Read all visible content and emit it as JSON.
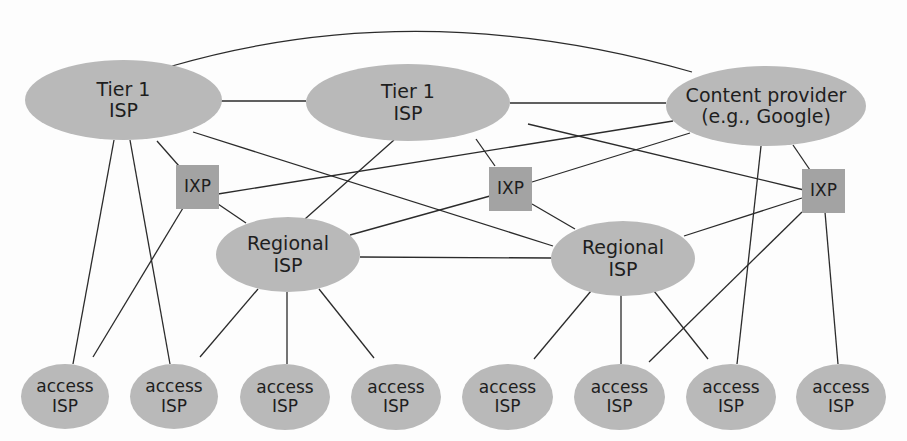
{
  "diagram": {
    "type": "network-topology",
    "colors": {
      "node_fill": "#b9b9b9",
      "ixp_fill": "#a3a3a3",
      "edge": "#2b2b2b",
      "text": "#1e1e1e",
      "background": "#fdfdfd"
    },
    "nodes": {
      "tier1_a": {
        "line1": "Tier 1",
        "line2": "ISP",
        "kind": "tier1-isp"
      },
      "tier1_b": {
        "line1": "Tier 1",
        "line2": "ISP",
        "kind": "tier1-isp"
      },
      "content": {
        "line1": "Content provider",
        "line2": "(e.g., Google)",
        "kind": "content-provider"
      },
      "ixp_1": {
        "label": "IXP",
        "kind": "ixp"
      },
      "ixp_2": {
        "label": "IXP",
        "kind": "ixp"
      },
      "ixp_3": {
        "label": "IXP",
        "kind": "ixp"
      },
      "regional_a": {
        "line1": "Regional",
        "line2": "ISP",
        "kind": "regional-isp"
      },
      "regional_b": {
        "line1": "Regional",
        "line2": "ISP",
        "kind": "regional-isp"
      },
      "access": [
        {
          "line1": "access",
          "line2": "ISP"
        },
        {
          "line1": "access",
          "line2": "ISP"
        },
        {
          "line1": "access",
          "line2": "ISP"
        },
        {
          "line1": "access",
          "line2": "ISP"
        },
        {
          "line1": "access",
          "line2": "ISP"
        },
        {
          "line1": "access",
          "line2": "ISP"
        },
        {
          "line1": "access",
          "line2": "ISP"
        },
        {
          "line1": "access",
          "line2": "ISP"
        }
      ]
    },
    "edges": [
      [
        "tier1_a",
        "content",
        "arc"
      ],
      [
        "tier1_a",
        "tier1_b"
      ],
      [
        "tier1_a",
        "ixp_1"
      ],
      [
        "tier1_a",
        "regional_b"
      ],
      [
        "tier1_a",
        "access_1"
      ],
      [
        "tier1_a",
        "access_2"
      ],
      [
        "tier1_b",
        "content"
      ],
      [
        "tier1_b",
        "ixp_2"
      ],
      [
        "tier1_b",
        "regional_a"
      ],
      [
        "tier1_b",
        "ixp_3"
      ],
      [
        "content",
        "ixp_1"
      ],
      [
        "content",
        "ixp_2"
      ],
      [
        "content",
        "ixp_3"
      ],
      [
        "content",
        "access_7"
      ],
      [
        "ixp_1",
        "regional_a"
      ],
      [
        "ixp_1",
        "access_1"
      ],
      [
        "ixp_2",
        "regional_a"
      ],
      [
        "ixp_2",
        "regional_b"
      ],
      [
        "ixp_3",
        "regional_b"
      ],
      [
        "ixp_3",
        "access_6"
      ],
      [
        "ixp_3",
        "access_8"
      ],
      [
        "regional_a",
        "regional_b"
      ],
      [
        "regional_a",
        "access_2"
      ],
      [
        "regional_a",
        "access_3"
      ],
      [
        "regional_a",
        "access_4"
      ],
      [
        "regional_b",
        "access_5"
      ],
      [
        "regional_b",
        "access_6"
      ],
      [
        "regional_b",
        "access_7"
      ]
    ]
  }
}
